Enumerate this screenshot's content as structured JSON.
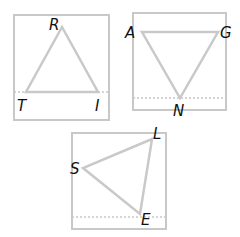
{
  "figures": [
    {
      "name": "triangle-RTI",
      "vertices": [
        {
          "label": "R"
        },
        {
          "label": "T"
        },
        {
          "label": "I"
        }
      ]
    },
    {
      "name": "triangle-AGN",
      "vertices": [
        {
          "label": "A"
        },
        {
          "label": "G"
        },
        {
          "label": "N"
        }
      ]
    },
    {
      "name": "triangle-SLE",
      "vertices": [
        {
          "label": "S"
        },
        {
          "label": "L"
        },
        {
          "label": "E"
        }
      ]
    }
  ],
  "colors": {
    "stroke": "#c8c8c8",
    "label": "#111111"
  }
}
